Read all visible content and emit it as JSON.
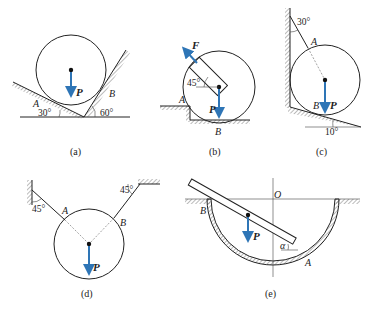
{
  "figure": {
    "panels": [
      {
        "id": "a",
        "caption": "(a)",
        "labels": {
          "A": "A",
          "B": "B",
          "P": "P"
        },
        "angles": {
          "left_incline": "30°",
          "right_incline": "60°"
        }
      },
      {
        "id": "b",
        "caption": "(b)",
        "labels": {
          "A": "A",
          "B": "B",
          "P": "P",
          "F": "F"
        },
        "angles": {
          "handle": "45°"
        }
      },
      {
        "id": "c",
        "caption": "(c)",
        "labels": {
          "A": "A",
          "B": "B",
          "P": "P"
        },
        "angles": {
          "rope": "30°",
          "incline": "10°"
        }
      },
      {
        "id": "d",
        "caption": "(d)",
        "labels": {
          "A": "A",
          "B": "B",
          "P": "P"
        },
        "angles": {
          "left_rope": "45°",
          "right_rope": "45°"
        }
      },
      {
        "id": "e",
        "caption": "(e)",
        "labels": {
          "A": "A",
          "B": "B",
          "P": "P",
          "O": "O"
        },
        "angles": {
          "rod": "α"
        }
      }
    ],
    "colors": {
      "force_arrow": "#2e75b6",
      "line": "#222222"
    }
  }
}
